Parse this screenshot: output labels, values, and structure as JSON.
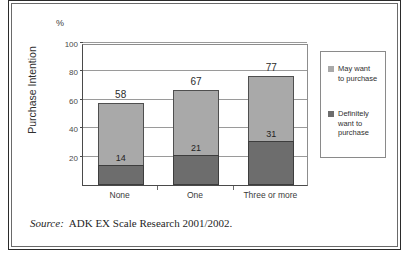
{
  "figure": {
    "unit_label": "%",
    "source_label": "Source:",
    "source_text": "ADK EX Scale Research 2001/2002."
  },
  "chart_data": {
    "type": "bar",
    "stacked": true,
    "title": "",
    "subtitle": "",
    "xlabel": "",
    "ylabel": "Purchase Intention",
    "unit": "%",
    "categories": [
      "None",
      "One",
      "Three or more"
    ],
    "ylim": [
      0,
      100
    ],
    "yticks": [
      20,
      40,
      60,
      80,
      100
    ],
    "ytick_labels": [
      "20",
      "40",
      "60",
      "80",
      "100"
    ],
    "grid": true,
    "legend_position": "right",
    "series": [
      {
        "name": "Definitely want to purchase",
        "color": "#6d6d6d",
        "values": [
          14,
          21,
          31
        ]
      },
      {
        "name": "May want to purchase",
        "color": "#a9a9a9",
        "values": [
          44,
          46,
          46
        ]
      }
    ],
    "totals": [
      58,
      67,
      77
    ],
    "total_labels": [
      "58",
      "67",
      "77"
    ],
    "segment_labels": [
      "14",
      "21",
      "31"
    ],
    "legend": [
      {
        "label_line1": "May want",
        "label_line2": "to purchase",
        "color": "#a9a9a9"
      },
      {
        "label_line1": "Definitely",
        "label_line2": "want to",
        "label_line3": "purchase",
        "color": "#6d6d6d"
      }
    ]
  }
}
